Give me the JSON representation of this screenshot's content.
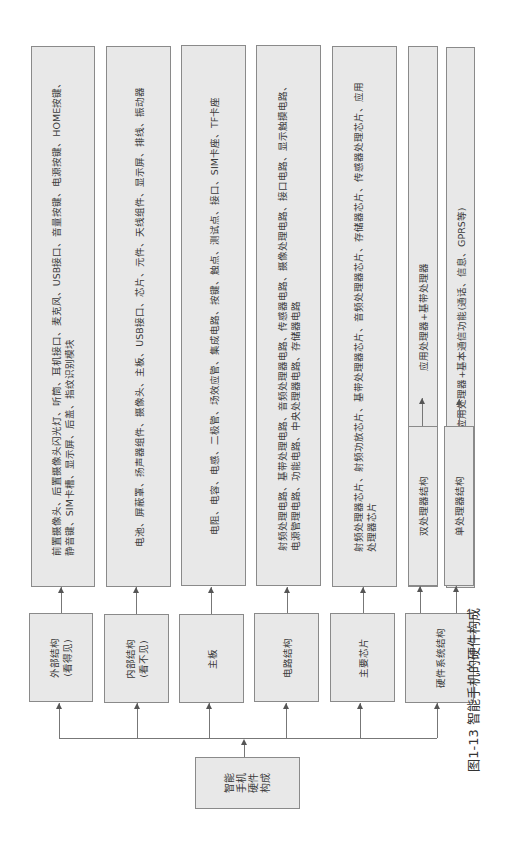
{
  "root": {
    "label_lines": [
      "智能",
      "手机",
      "硬件",
      "构成"
    ]
  },
  "categories": [
    {
      "label_lines": [
        "外部结构",
        "(看得见)"
      ],
      "detail_lines": [
        "前置摄像头、后置摄像头闪光灯、听筒、耳机接口、麦克风、USB接口、音量按键、电源按键、HOME按键、",
        "静音键、SIM卡槽、显示屏、后盖、指纹识别模块"
      ]
    },
    {
      "label_lines": [
        "内部结构",
        "(看不见)"
      ],
      "detail_lines": [
        "电池、屏蔽罩、扬声器组件、摄像头、主板、USB接口、芯片、元件、天线组件、显示屏、排线、振动器"
      ]
    },
    {
      "label_lines": [
        "主板"
      ],
      "detail_lines": [
        "电阻、电容、电感、二极管、场效应管、集成电路、按键、触点、测试点、接口、SIM卡座、TF卡座"
      ]
    },
    {
      "label_lines": [
        "电路结构"
      ],
      "detail_lines": [
        "射频处理电路、基带处理电路、音频处理器电路、传感器电路、摄像处理电路、接口电路、显示触摸电路、",
        "电源管理电路、功能电路、中央处理器电路、存储器电路"
      ]
    },
    {
      "label_lines": [
        "主要芯片"
      ],
      "detail_lines": [
        "射频处理器芯片、射频功放芯片、基带处理器芯片、音频处理器芯片、存储器芯片、传感器处理芯片、应用",
        "处理器芯片"
      ]
    },
    {
      "label_lines": [
        "硬件系统结构"
      ],
      "sub": [
        {
          "label": "双处理器结构",
          "detail": "应用处理器+基带处理器"
        },
        {
          "label": "单处理器结构",
          "detail": "应用处理器+基本通信功能(通话、信息、GPRS等)"
        }
      ]
    }
  ],
  "caption": "图1-13  智能手机的硬件构成"
}
